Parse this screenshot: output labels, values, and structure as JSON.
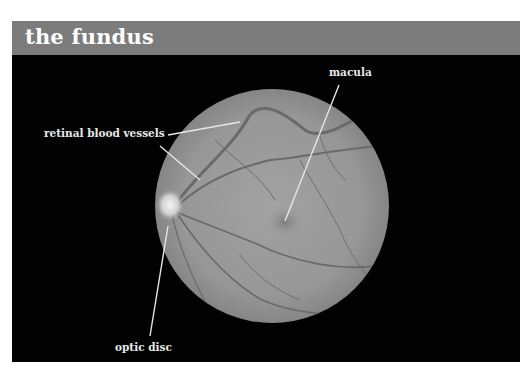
{
  "header": {
    "title": "the fundus",
    "background_color": "#7c7c7c"
  },
  "figure": {
    "background_color": "#020202",
    "fundus_color": "#9a9a9a",
    "labels": {
      "macula": "macula",
      "retinal_blood_vessels": "retinal blood vessels",
      "optic_disc": "optic disc"
    }
  }
}
